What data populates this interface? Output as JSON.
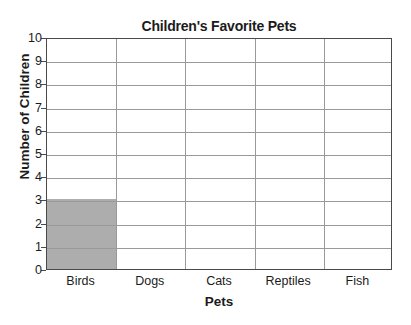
{
  "chart_data": {
    "type": "bar",
    "title": "Children's Favorite Pets",
    "xlabel": "Pets",
    "ylabel": "Number of Children",
    "categories": [
      "Birds",
      "Dogs",
      "Cats",
      "Reptiles",
      "Fish"
    ],
    "values": [
      3,
      0,
      0,
      0,
      0
    ],
    "ylim": [
      0,
      10
    ],
    "ytick_labels": [
      "0",
      "1",
      "2",
      "3",
      "4",
      "5",
      "6",
      "7",
      "8",
      "9",
      "10"
    ],
    "ytick_values": [
      0,
      1,
      2,
      3,
      4,
      5,
      6,
      7,
      8,
      9,
      10
    ],
    "grid": "horizontal-and-category-dividers",
    "legend": "none",
    "bar_color": "#adadad",
    "gridline_color": "#9a9a9a",
    "axis_color": "#4a4a4a",
    "text_color": "#1b1b1b"
  }
}
